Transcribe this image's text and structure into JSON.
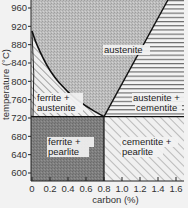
{
  "diagram": {
    "type": "phase-diagram",
    "title": "",
    "x_axis": {
      "label": "carbon (%)",
      "range": [
        0,
        1.7
      ],
      "ticks": [
        "0",
        "0.2",
        "0.4",
        "0.6",
        "0.8",
        "1.0",
        "1.2",
        "1.4",
        "1.6"
      ],
      "tick_values": [
        0,
        0.2,
        0.4,
        0.6,
        0.8,
        1.0,
        1.2,
        1.4,
        1.6
      ]
    },
    "y_axis": {
      "label": "temperature (°C)",
      "range": [
        580,
        978
      ],
      "ticks": [
        "960",
        "920",
        "880",
        "840",
        "800",
        "760",
        "720",
        "680",
        "640",
        "600"
      ],
      "tick_values": [
        960,
        920,
        880,
        840,
        800,
        760,
        720,
        680,
        640,
        600
      ]
    },
    "eutectoid_point": {
      "carbon": 0.8,
      "temperature": 723
    },
    "boundaries": {
      "a3_curve": [
        [
          0,
          910
        ],
        [
          0.05,
          880
        ],
        [
          0.2,
          820
        ],
        [
          0.4,
          775
        ],
        [
          0.6,
          745
        ],
        [
          0.8,
          723
        ]
      ],
      "acm_line": [
        [
          0.8,
          723
        ],
        [
          1.51,
          978
        ]
      ],
      "eutectoid_line": [
        [
          0,
          723
        ],
        [
          1.7,
          723
        ]
      ],
      "ferrite_solvus": [
        [
          0,
          910
        ],
        [
          0.02,
          723
        ]
      ]
    },
    "regions": [
      {
        "name": "austenite",
        "label_lines": [
          "austenite"
        ],
        "fill": "#b8b8b8",
        "pattern": "stipple"
      },
      {
        "name": "ferrite-austenite",
        "label_lines": [
          "ferrite +",
          "austenite"
        ],
        "fill": "#e8e8e8",
        "pattern": "diagonal-hatch"
      },
      {
        "name": "austenite-cementite",
        "label_lines": [
          "austenite +",
          "cementite"
        ],
        "fill": "#eeeeee",
        "pattern": "horizontal-lines"
      },
      {
        "name": "ferrite-pearlite",
        "label_lines": [
          "ferrite +",
          "pearlite"
        ],
        "fill": "#7a7a7a",
        "pattern": "stipple-dark"
      },
      {
        "name": "cementite-pearlite",
        "label_lines": [
          "cementite +",
          "pearlite"
        ],
        "fill": "#eeeeee",
        "pattern": "diagonal-hatch-light"
      }
    ],
    "colors": {
      "line": "#111111",
      "austenite": "#b5b5b5",
      "ferrite_pearlite": "#7c7c7c",
      "hatch": "#555555",
      "background": "#f2f2f2"
    }
  }
}
